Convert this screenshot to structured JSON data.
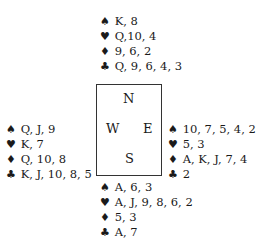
{
  "north": {
    "spades": "K, 8",
    "hearts": "Q,10, 4",
    "diamonds": "9, 6, 2",
    "clubs": "Q, 9, 6, 4, 3"
  },
  "west": {
    "spades": "Q, J, 9",
    "hearts": "K, 7",
    "diamonds": "Q, 10, 8",
    "clubs": "K, J, 10, 8, 5"
  },
  "east": {
    "spades": "10, 7, 5, 4, 2",
    "hearts": "5, 3",
    "diamonds": "A, K, J, 7, 4",
    "clubs": "2"
  },
  "south": {
    "spades": "A, 6, 3",
    "hearts": "A, J, 9, 8, 6, 2",
    "diamonds": "5, 3",
    "clubs": "A, 7"
  },
  "compass": {
    "n": "N",
    "w": "W",
    "e": "E",
    "s": "S"
  },
  "symbols": {
    "spades": "♠",
    "hearts": "♥",
    "diamonds": "♦",
    "clubs": "♣"
  }
}
